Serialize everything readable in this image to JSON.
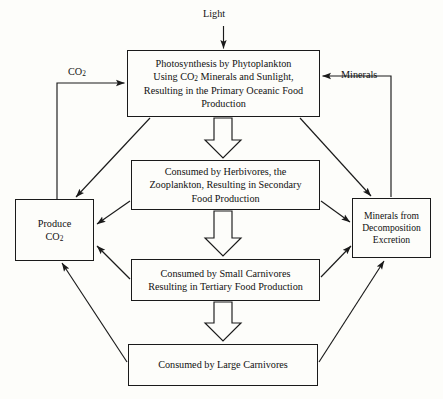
{
  "diagram": {
    "background_color": "#fdfdfa",
    "line_color": "#1a1a1a",
    "text_color": "#111111"
  },
  "nodes": {
    "photosynthesis": {
      "label": "Photosynthesis by Phytoplankton\nUsing CO2 Minerals and Sunlight,\nResulting in the Primary Oceanic Food\nProduction",
      "line1": "Photosynthesis by Phytoplankton",
      "line2_a": "Using CO",
      "line2_sub": "2",
      "line2_b": " Minerals and Sunlight,",
      "line3": "Resulting in the Primary Oceanic Food",
      "line4": "Production"
    },
    "herbivores": {
      "label": "Consumed by Herbivores, the\nZooplankton, Resulting in Secondary\nFood Production"
    },
    "small_carnivores": {
      "label": "Consumed by Small Carnivores\nResulting in Tertiary Food Production"
    },
    "large_carnivores": {
      "label": "Consumed by Large Carnivores"
    },
    "produce_co2": {
      "line1": "Produce",
      "line2_a": "CO",
      "line2_sub": "2"
    },
    "minerals_from": {
      "label": "Minerals from\nDecomposition\nExcretion"
    }
  },
  "edge_labels": {
    "light": "Light",
    "co2_a": "CO",
    "co2_sub": "2",
    "minerals": "Minerals"
  }
}
